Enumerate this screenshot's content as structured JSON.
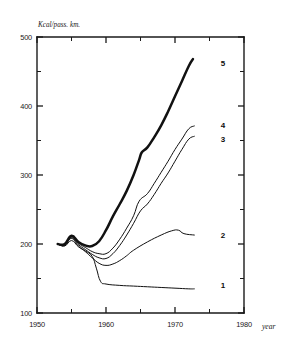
{
  "chart_data": {
    "type": "line",
    "title": "",
    "xlabel": "year",
    "ylabel": "Kcal/pass. km.",
    "xlim": [
      1950,
      1980
    ],
    "ylim": [
      100,
      500
    ],
    "grid": false,
    "legend_position": "right-inline",
    "x_ticks_major": [
      1950,
      1960,
      1970,
      1980
    ],
    "x_ticks_minor": [
      1955,
      1965,
      1975
    ],
    "y_ticks_major": [
      100,
      200,
      300,
      400,
      500
    ],
    "y_ticks_minor": [
      150,
      250,
      350,
      450
    ],
    "x_tick_labels": [
      "1950",
      "1960",
      "1970",
      "1980"
    ],
    "y_tick_labels": [
      "100",
      "200",
      "300",
      "400",
      "500"
    ],
    "series": [
      {
        "name": "1",
        "label": "1",
        "emphasis": "thin",
        "x": [
          1953,
          1954,
          1955,
          1956,
          1957,
          1958,
          1958.6,
          1959.2,
          1960,
          1962,
          1964,
          1966,
          1968,
          1970,
          1972,
          1972.8
        ],
        "values": [
          200,
          197,
          205,
          196,
          190,
          182,
          165,
          146,
          142,
          140,
          139,
          138,
          137,
          136,
          135,
          135
        ]
      },
      {
        "name": "2",
        "label": "2",
        "emphasis": "thin",
        "x": [
          1953,
          1954,
          1955,
          1956,
          1957,
          1958,
          1959,
          1960,
          1961,
          1962,
          1963,
          1964,
          1966,
          1968,
          1969.5,
          1970.5,
          1971.3,
          1972.8
        ],
        "values": [
          200,
          198,
          208,
          197,
          189,
          180,
          172,
          169,
          171,
          176,
          183,
          191,
          203,
          213,
          219,
          220,
          215,
          213
        ]
      },
      {
        "name": "3",
        "label": "3",
        "emphasis": "thin",
        "x": [
          1953,
          1954,
          1955,
          1956,
          1957,
          1958,
          1959,
          1960,
          1961,
          1962,
          1963,
          1964,
          1965,
          1966,
          1967,
          1968,
          1969,
          1970,
          1971,
          1972,
          1972.8
        ],
        "values": [
          200,
          198,
          209,
          199,
          192,
          185,
          180,
          179,
          186,
          198,
          213,
          230,
          248,
          258,
          272,
          288,
          303,
          320,
          337,
          352,
          356
        ]
      },
      {
        "name": "4",
        "label": "4",
        "emphasis": "thin",
        "x": [
          1953,
          1954,
          1955,
          1956,
          1957,
          1958,
          1959,
          1960,
          1961,
          1962,
          1963,
          1964,
          1964.8,
          1966,
          1967,
          1968,
          1969,
          1970,
          1971,
          1972,
          1972.8
        ],
        "values": [
          200,
          199,
          210,
          201,
          195,
          189,
          186,
          186,
          194,
          207,
          223,
          241,
          262,
          273,
          288,
          304,
          320,
          337,
          352,
          367,
          371
        ]
      },
      {
        "name": "5",
        "label": "5",
        "emphasis": "bold",
        "x": [
          1953,
          1954,
          1955,
          1956,
          1957,
          1958,
          1959,
          1960,
          1961,
          1962,
          1963,
          1964,
          1964.8,
          1965.2,
          1966,
          1967,
          1968,
          1969,
          1970,
          1971,
          1972,
          1972.6
        ],
        "values": [
          200,
          200,
          212,
          203,
          198,
          197,
          204,
          220,
          240,
          258,
          277,
          300,
          322,
          333,
          340,
          355,
          372,
          392,
          414,
          436,
          458,
          468
        ]
      }
    ],
    "series_label_positions": [
      {
        "label": "5",
        "y_value": 462
      },
      {
        "label": "4",
        "y_value": 372
      },
      {
        "label": "3",
        "y_value": 352
      },
      {
        "label": "2",
        "y_value": 213
      },
      {
        "label": "1",
        "y_value": 140
      }
    ]
  }
}
